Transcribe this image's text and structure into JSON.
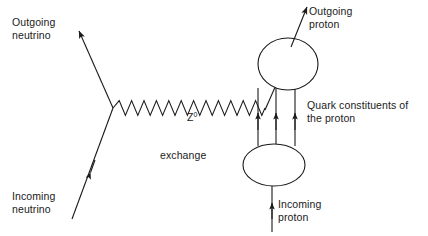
{
  "figure": {
    "type": "feynman-diagram",
    "background_color": "#ffffff",
    "line_color": "#1a1a1a",
    "text_color": "#1a1a1a"
  },
  "labels": {
    "outgoing_neutrino": "Outgoing\nneutrino",
    "incoming_neutrino": "Incoming\nneutrino",
    "z_symbol": "Z",
    "z_superscript": "0",
    "z_exchange": "exchange",
    "outgoing_proton": "Outgoing\nproton",
    "incoming_proton": "Incoming\nproton",
    "quark_constituents": "Quark constituents of\nthe proton"
  },
  "elements": {
    "outgoing_neutrino_line": "arrow-up-left",
    "incoming_neutrino_line": "arrow-up-right",
    "boson_propagator": "wavy-line",
    "upper_proton_blob": "ellipse",
    "lower_proton_blob": "ellipse",
    "quark_lines": "three-vertical-arrows",
    "outgoing_proton_arrow": "arrow-up-right",
    "incoming_proton_arrow": "arrow-up"
  }
}
